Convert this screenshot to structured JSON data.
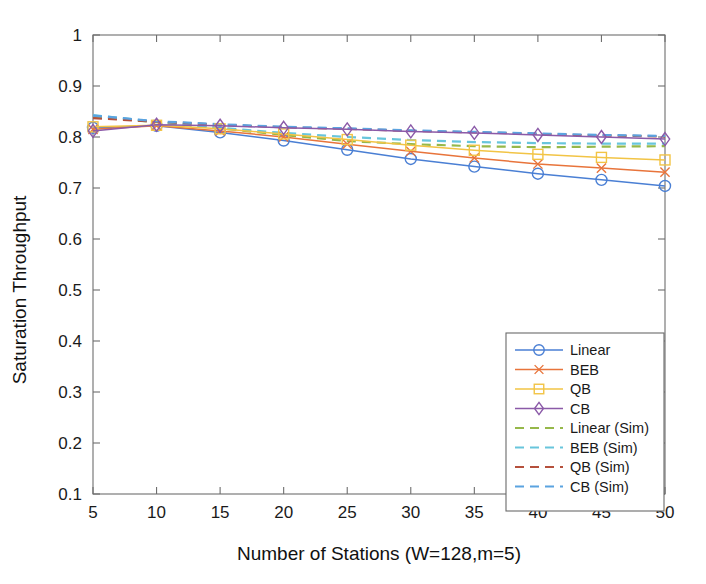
{
  "figure": {
    "background": "#ffffff"
  },
  "chart_data": {
    "type": "line",
    "title": "",
    "xlabel": "Number of Stations (W=128,m=5)",
    "ylabel": "Saturation Throughput",
    "xlim": [
      5,
      50
    ],
    "ylim": [
      0.1,
      1
    ],
    "xticks": [
      5,
      10,
      15,
      20,
      25,
      30,
      35,
      40,
      45,
      50
    ],
    "xticklabels": [
      "5",
      "10",
      "15",
      "20",
      "25",
      "30",
      "35",
      "40",
      "45",
      "50"
    ],
    "yticks": [
      0.1,
      0.2,
      0.3,
      0.4,
      0.5,
      0.6,
      0.7,
      0.8,
      0.9,
      1
    ],
    "yticklabels": [
      "0.1",
      "0.2",
      "0.3",
      "0.4",
      "0.5",
      "0.6",
      "0.7",
      "0.8",
      "0.9",
      "1"
    ],
    "grid": false,
    "legend_position": "lower right",
    "x": [
      5,
      10,
      15,
      20,
      25,
      30,
      35,
      40,
      45,
      50
    ],
    "series": [
      {
        "name": "Linear",
        "color": "#4a7fd4",
        "style": "solid",
        "marker": "circle",
        "values": [
          0.818,
          0.822,
          0.809,
          0.793,
          0.775,
          0.757,
          0.742,
          0.728,
          0.716,
          0.704
        ]
      },
      {
        "name": "BEB",
        "color": "#e8743b",
        "style": "solid",
        "marker": "x",
        "values": [
          0.815,
          0.822,
          0.812,
          0.8,
          0.786,
          0.772,
          0.759,
          0.747,
          0.739,
          0.731
        ]
      },
      {
        "name": "QB",
        "color": "#f2c445",
        "style": "solid",
        "marker": "square",
        "values": [
          0.82,
          0.823,
          0.816,
          0.806,
          0.795,
          0.784,
          0.774,
          0.766,
          0.76,
          0.755
        ]
      },
      {
        "name": "CB",
        "color": "#8b5aa8",
        "style": "solid",
        "marker": "diamond",
        "values": [
          0.812,
          0.824,
          0.822,
          0.818,
          0.815,
          0.811,
          0.808,
          0.804,
          0.8,
          0.796
        ]
      },
      {
        "name": "Linear (Sim)",
        "color": "#96b84a",
        "style": "dashed",
        "marker": "none",
        "values": [
          0.84,
          0.829,
          0.817,
          0.804,
          0.792,
          0.786,
          0.782,
          0.78,
          0.781,
          0.782
        ]
      },
      {
        "name": "BEB (Sim)",
        "color": "#68c5dc",
        "style": "dashed",
        "marker": "none",
        "values": [
          0.843,
          0.83,
          0.818,
          0.808,
          0.8,
          0.794,
          0.79,
          0.788,
          0.787,
          0.787
        ]
      },
      {
        "name": "QB (Sim)",
        "color": "#b5503c",
        "style": "dashed",
        "marker": "none",
        "values": [
          0.837,
          0.83,
          0.824,
          0.819,
          0.816,
          0.812,
          0.809,
          0.806,
          0.803,
          0.801
        ]
      },
      {
        "name": "CB (Sim)",
        "color": "#5ba3e0",
        "style": "dashed",
        "marker": "none",
        "values": [
          0.842,
          0.831,
          0.825,
          0.82,
          0.817,
          0.813,
          0.81,
          0.807,
          0.804,
          0.802
        ]
      }
    ]
  }
}
